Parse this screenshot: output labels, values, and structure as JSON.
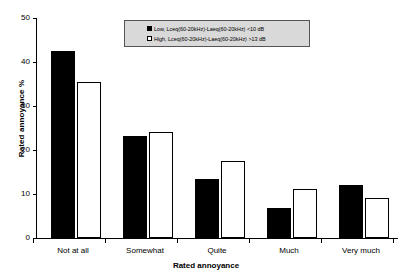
{
  "chart_data": {
    "type": "bar",
    "title": "",
    "xlabel": "Rated annoyance",
    "ylabel": "Rated annoyance %",
    "ylim": [
      0,
      50
    ],
    "yticks": [
      0,
      10,
      20,
      30,
      40,
      50
    ],
    "ytick_labels": [
      "0",
      "10",
      "20",
      "30",
      "40",
      "50"
    ],
    "grid": false,
    "legend_position": "top-center",
    "categories": [
      "Not at all",
      "Somewhat",
      "Quite",
      "Much",
      "Very much"
    ],
    "series": [
      {
        "name": "Low, Lceq(60-20kHz)-Laeq(60-20kHz) <10 dB",
        "short_name": "Low",
        "color": "#000000",
        "values": [
          42.5,
          23.2,
          13.5,
          6.8,
          12.1
        ]
      },
      {
        "name": "High, Lceq(60-20kHz)-Laeq(60-20kHz) >13 dB",
        "short_name": "High",
        "color": "#ffffff",
        "values": [
          35.5,
          24.2,
          17.4,
          11.1,
          9.2
        ]
      }
    ]
  },
  "legend": {
    "items": [
      {
        "swatch": "filled-square-icon",
        "label": "Low, Lceq(60-20kHz)-Laeq(60-20kHz) <10 dB"
      },
      {
        "swatch": "open-square-icon",
        "label": "High, Lceq(60-20kHz)-Laeq(60-20kHz) >13 dB"
      }
    ]
  }
}
